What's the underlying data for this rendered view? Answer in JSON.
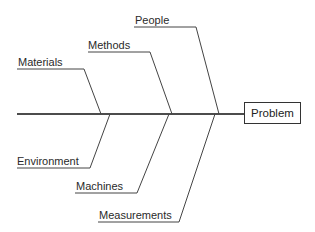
{
  "diagram": {
    "type": "fishbone",
    "effect": "Problem",
    "causes_top": [
      {
        "label": "Materials"
      },
      {
        "label": "Methods"
      },
      {
        "label": "People"
      }
    ],
    "causes_bottom": [
      {
        "label": "Environment"
      },
      {
        "label": "Machines"
      },
      {
        "label": "Measurements"
      }
    ],
    "colors": {
      "line": "#333333",
      "spine": "#111111",
      "text": "#2a2a2a"
    }
  }
}
